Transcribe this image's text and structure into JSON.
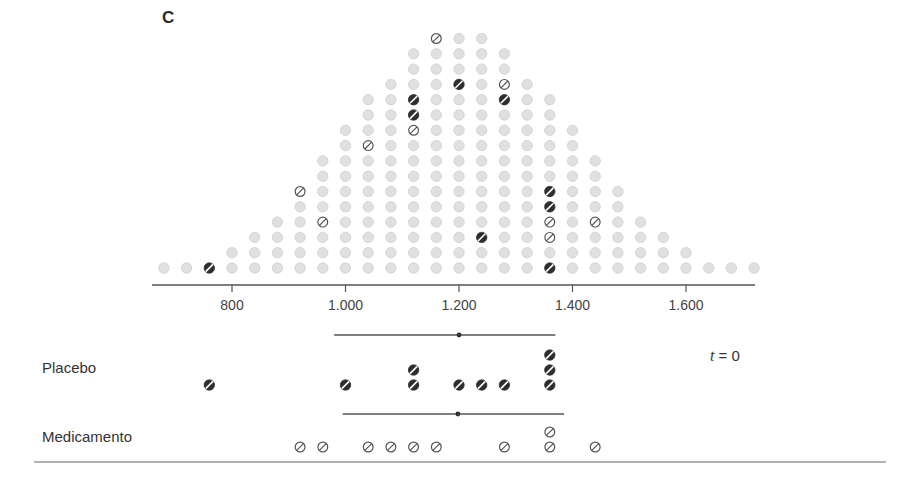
{
  "panel": {
    "label": "C"
  },
  "groups": {
    "placebo_label": "Placebo",
    "drug_label": "Medicamento",
    "time_var": "t",
    "time_eq": " = 0"
  },
  "colors": {
    "population_dot": "#e0e0e0",
    "population_dot_stroke": "#cfcfcf",
    "placebo_dot": "#2e2e2e",
    "drug_dot_stroke": "#555555",
    "axis": "#555555"
  },
  "chart_data": {
    "type": "scatter",
    "subtype": "dot-plot (population histogram with two sampled groups)",
    "title": "C",
    "xlabel": "",
    "ylabel": "",
    "xlim": [
      680,
      1720
    ],
    "bin_width": 40,
    "x_ticks": [
      800,
      1000,
      1200,
      1400,
      1600
    ],
    "x_tick_labels": [
      "800",
      "1.000",
      "1.200",
      "1.400",
      "1.600"
    ],
    "annotation": "t = 0",
    "population": {
      "bins": [
        680,
        720,
        760,
        800,
        840,
        880,
        920,
        960,
        1000,
        1040,
        1080,
        1120,
        1160,
        1200,
        1240,
        1280,
        1320,
        1360,
        1400,
        1440,
        1480,
        1520,
        1560,
        1600,
        1640,
        1680,
        1720
      ],
      "counts": [
        1,
        1,
        1,
        2,
        3,
        4,
        6,
        8,
        10,
        12,
        13,
        15,
        16,
        16,
        16,
        15,
        13,
        12,
        10,
        8,
        6,
        4,
        3,
        2,
        1,
        1,
        1
      ]
    },
    "highlighted_in_population": {
      "placebo": [
        [
          760,
          1
        ],
        [
          1120,
          11
        ],
        [
          1120,
          12
        ],
        [
          1200,
          13
        ],
        [
          1240,
          3
        ],
        [
          1280,
          12
        ],
        [
          1360,
          1
        ],
        [
          1360,
          5
        ],
        [
          1360,
          6
        ]
      ],
      "drug": [
        [
          920,
          6
        ],
        [
          960,
          4
        ],
        [
          1040,
          9
        ],
        [
          1120,
          10
        ],
        [
          1160,
          16
        ],
        [
          1280,
          13
        ],
        [
          1360,
          3
        ],
        [
          1360,
          4
        ],
        [
          1440,
          4
        ]
      ]
    },
    "series": [
      {
        "name": "Placebo",
        "values": [
          760,
          1000,
          1120,
          1120,
          1200,
          1240,
          1280,
          1360,
          1360,
          1360
        ],
        "mean": 1200,
        "interval": [
          980,
          1370
        ]
      },
      {
        "name": "Medicamento",
        "values": [
          920,
          960,
          1040,
          1080,
          1120,
          1160,
          1280,
          1360,
          1360,
          1440
        ],
        "mean": 1198,
        "interval": [
          995,
          1385
        ]
      }
    ]
  }
}
